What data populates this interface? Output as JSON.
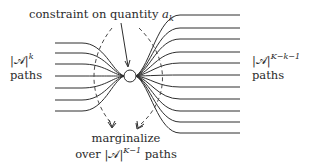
{
  "diagram": {
    "title_label": "constraint on quantity",
    "title_symbol": "a",
    "title_symbol_sub": "k",
    "left_label": {
      "set": "|𝒜|",
      "exponent": "k",
      "paths": "paths"
    },
    "right_label": {
      "set": "|𝒜|",
      "exponent": "K−k−1",
      "paths": "paths"
    },
    "bottom_label": {
      "line1": "marginalize",
      "line2_prefix": "over ",
      "set": "|𝒜|",
      "exponent": "K−1",
      "line2_suffix": " paths"
    },
    "node": {
      "cx": 130,
      "cy": 76,
      "r": 6
    },
    "left_paths_y": [
      43,
      53,
      64,
      76,
      88,
      100,
      111
    ],
    "right_paths_y": [
      15,
      28,
      39,
      52,
      63,
      75,
      87,
      99,
      111,
      122,
      133
    ],
    "left_x_start": 55,
    "right_x_end": 240,
    "colors": {
      "stroke": "#2e2e2e",
      "text": "#2a2a2a",
      "background": "#ffffff"
    }
  }
}
